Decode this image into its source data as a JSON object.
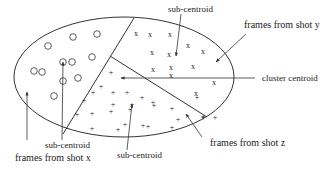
{
  "diagram": {
    "type": "cluster-partition",
    "colors": {
      "stroke": "#333333",
      "text": "#222222",
      "background": "#ffffff"
    },
    "ellipse": {
      "cx": 124,
      "cy": 77,
      "rx": 110,
      "ry": 60
    },
    "dividers": [
      {
        "x1": 134,
        "y1": 18,
        "x2": 63,
        "y2": 134
      },
      {
        "x1": 110,
        "y1": 56,
        "x2": 207,
        "y2": 117
      }
    ],
    "regions": {
      "x": {
        "marker": "circle",
        "label": "frames from shot x",
        "points": [
          [
            48,
            46
          ],
          [
            73,
            37
          ],
          [
            97,
            34
          ],
          [
            42,
            72
          ],
          [
            63,
            62
          ],
          [
            72,
            62
          ],
          [
            92,
            57
          ],
          [
            63,
            81
          ],
          [
            78,
            78
          ],
          [
            34,
            71
          ],
          [
            54,
            96
          ]
        ]
      },
      "y": {
        "marker": "x",
        "label": "frames from shot y",
        "points": [
          [
            136,
            33
          ],
          [
            150,
            34
          ],
          [
            170,
            34
          ],
          [
            152,
            52
          ],
          [
            169,
            54
          ],
          [
            188,
            45
          ],
          [
            203,
            51
          ],
          [
            153,
            69
          ],
          [
            171,
            67
          ],
          [
            193,
            66
          ],
          [
            171,
            75
          ],
          [
            214,
            82
          ],
          [
            196,
            93
          ]
        ]
      },
      "z": {
        "marker": "+",
        "label": "frames from shot z",
        "points": [
          [
            111,
            72
          ],
          [
            101,
            86
          ],
          [
            93,
            92
          ],
          [
            113,
            92
          ],
          [
            127,
            92
          ],
          [
            84,
            100
          ],
          [
            142,
            97
          ],
          [
            113,
            104
          ],
          [
            132,
            104
          ],
          [
            153,
            102
          ],
          [
            77,
            114
          ],
          [
            92,
            113
          ],
          [
            111,
            111
          ],
          [
            130,
            109
          ],
          [
            154,
            105
          ],
          [
            172,
            108
          ],
          [
            197,
            97
          ],
          [
            203,
            116
          ],
          [
            178,
            119
          ],
          [
            125,
            124
          ],
          [
            143,
            125
          ],
          [
            92,
            128
          ],
          [
            118,
            129
          ],
          [
            148,
            126
          ],
          [
            172,
            127
          ],
          [
            203,
            117
          ],
          [
            215,
            117
          ]
        ]
      }
    },
    "labels": {
      "sub_centroid_top": "sub-centroid",
      "frames_y": "frames from shot y",
      "cluster_centroid": "cluster centroid",
      "frames_z": "frames from shot z",
      "sub_centroid_bottom_left": "sub-centroid",
      "frames_x": "frames from shot x",
      "sub_centroid_bottom_mid": "sub-centroid"
    }
  }
}
